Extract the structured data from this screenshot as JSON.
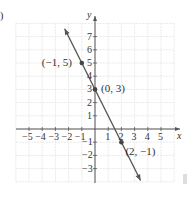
{
  "chart_data": {
    "type": "line",
    "title": "",
    "xlabel": "x",
    "ylabel": "y",
    "xlim": [
      -6,
      6
    ],
    "ylim": [
      -4,
      8
    ],
    "grid": true,
    "x_ticks": [
      -5,
      -4,
      -3,
      -2,
      -1,
      1,
      2,
      3,
      4,
      5
    ],
    "y_ticks": [
      -3,
      -2,
      -1,
      1,
      2,
      3,
      4,
      5,
      6,
      7
    ],
    "x_tick_labels": [
      "−5",
      "−4",
      "−3",
      "−2",
      "−1",
      "1",
      "2",
      "3",
      "4",
      "5"
    ],
    "y_tick_labels": [
      "−3",
      "−2",
      "−1",
      "1",
      "2",
      "3",
      "4",
      "5",
      "6",
      "7"
    ],
    "line": {
      "equation": "y = -2x + 3",
      "slope": -2,
      "intercept": 3,
      "color": "#555555"
    },
    "points": [
      {
        "x": -1,
        "y": 5,
        "label": "(−1, 5)"
      },
      {
        "x": 0,
        "y": 3,
        "label": "(0, 3)"
      },
      {
        "x": 2,
        "y": -1,
        "label": "(2, −1)"
      }
    ]
  },
  "corner_label": ")"
}
